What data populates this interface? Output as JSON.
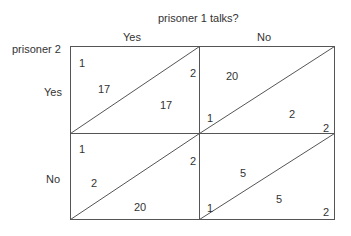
{
  "title": "prisoner 1 talks?",
  "row_player_label": "prisoner 2",
  "column_headers": [
    "Yes",
    "No"
  ],
  "row_headers": [
    "Yes",
    "No"
  ],
  "cells": [
    {
      "row": "Yes",
      "col": "Yes",
      "corner_top_left": "1",
      "upper_payoff": "17",
      "lower_payoff": "17",
      "corner_right": "2"
    },
    {
      "row": "Yes",
      "col": "No",
      "corner_bottom_left": "1",
      "upper_payoff": "20",
      "lower_payoff": "2",
      "corner_bottom_right": "2"
    },
    {
      "row": "No",
      "col": "Yes",
      "corner_top_left": "1",
      "upper_payoff": "2",
      "lower_payoff": "20",
      "corner_right": "2"
    },
    {
      "row": "No",
      "col": "No",
      "corner_bottom_left": "1",
      "upper_payoff": "5",
      "lower_payoff": "5",
      "corner_bottom_right": "2"
    }
  ],
  "colors": {
    "line": "#555555",
    "text": "#333333"
  }
}
